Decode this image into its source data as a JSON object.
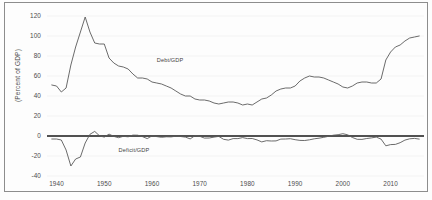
{
  "figure": {
    "ylabel": "(Percent of GDP)",
    "background": "#fdfdfd",
    "frame_color": "#8d8d8d"
  },
  "labels": {
    "debt": "Debt/GDP",
    "deficit": "Deficit/GDP"
  },
  "chart_data": {
    "type": "line",
    "title": "",
    "xlabel": "",
    "ylabel": "(Percent of GDP)",
    "xlim": [
      1938,
      2017
    ],
    "ylim": [
      -40,
      120
    ],
    "xticks": [
      1940,
      1950,
      1960,
      1970,
      1980,
      1990,
      2000,
      2010
    ],
    "xtick_labels": [
      "1940",
      "1950",
      "1960",
      "1970",
      "1980",
      "1990",
      "2000",
      "2010"
    ],
    "yticks": [
      -40,
      -20,
      0,
      20,
      40,
      60,
      80,
      100,
      120
    ],
    "ytick_labels": [
      "-40",
      "-20",
      "0",
      "20",
      "40",
      "60",
      "80",
      "100",
      "120"
    ],
    "grid": true,
    "grid_axis": "y",
    "grid_color": "#eeeeee",
    "legend": "inline-annotations",
    "zero_line": true,
    "zero_line_color": "#1a1a1a",
    "line_color": "#5a5a5a",
    "series": [
      {
        "name": "Debt/GDP",
        "label_position": {
          "x": 1961,
          "y": 76
        },
        "x": [
          1939,
          1940,
          1941,
          1942,
          1943,
          1944,
          1945,
          1946,
          1947,
          1948,
          1949,
          1950,
          1951,
          1952,
          1953,
          1954,
          1955,
          1956,
          1957,
          1958,
          1959,
          1960,
          1961,
          1962,
          1963,
          1964,
          1965,
          1966,
          1967,
          1968,
          1969,
          1970,
          1971,
          1972,
          1973,
          1974,
          1975,
          1976,
          1977,
          1978,
          1979,
          1980,
          1981,
          1982,
          1983,
          1984,
          1985,
          1986,
          1987,
          1988,
          1989,
          1990,
          1991,
          1992,
          1993,
          1994,
          1995,
          1996,
          1997,
          1998,
          1999,
          2000,
          2001,
          2002,
          2003,
          2004,
          2005,
          2006,
          2007,
          2008,
          2009,
          2010,
          2011,
          2012,
          2013,
          2014,
          2015,
          2016
        ],
        "values": [
          51,
          50,
          44,
          48,
          71,
          89,
          104,
          119,
          104,
          93,
          92,
          92,
          78,
          73,
          70,
          69,
          67,
          62,
          58,
          58,
          57,
          54,
          53,
          52,
          50,
          48,
          45,
          42,
          40,
          40,
          37,
          36,
          36,
          35,
          33,
          32,
          33,
          34,
          34,
          33,
          31,
          32,
          31,
          34,
          37,
          38,
          41,
          45,
          47,
          48,
          48,
          50,
          55,
          58,
          60,
          59,
          59,
          58,
          56,
          54,
          52,
          49,
          48,
          50,
          53,
          54,
          54,
          53,
          53,
          57,
          76,
          84,
          89,
          91,
          95,
          98,
          99,
          100
        ]
      },
      {
        "name": "Deficit/GDP",
        "label_position": {
          "x": 1953,
          "y": -14
        },
        "x": [
          1939,
          1940,
          1941,
          1942,
          1943,
          1944,
          1945,
          1946,
          1947,
          1948,
          1949,
          1950,
          1951,
          1952,
          1953,
          1954,
          1955,
          1956,
          1957,
          1958,
          1959,
          1960,
          1961,
          1962,
          1963,
          1964,
          1965,
          1966,
          1967,
          1968,
          1969,
          1970,
          1971,
          1972,
          1973,
          1974,
          1975,
          1976,
          1977,
          1978,
          1979,
          1980,
          1981,
          1982,
          1983,
          1984,
          1985,
          1986,
          1987,
          1988,
          1989,
          1990,
          1991,
          1992,
          1993,
          1994,
          1995,
          1996,
          1997,
          1998,
          1999,
          2000,
          2001,
          2002,
          2003,
          2004,
          2005,
          2006,
          2007,
          2008,
          2009,
          2010,
          2011,
          2012,
          2013,
          2014,
          2015,
          2016
        ],
        "values": [
          -3,
          -3,
          -4,
          -14,
          -30,
          -23,
          -21,
          -7,
          1.7,
          4.6,
          0.2,
          -1.1,
          1.9,
          -0.4,
          -1.7,
          -0.3,
          -0.8,
          0.9,
          0.8,
          -0.6,
          -2.6,
          0.1,
          -0.6,
          -1.3,
          -0.8,
          -0.9,
          -0.2,
          -0.5,
          -1.1,
          -2.9,
          0.3,
          -0.3,
          -2.1,
          -2,
          -1.1,
          -0.4,
          -3.3,
          -4.1,
          -2.6,
          -2.6,
          -1.6,
          -2.6,
          -2.5,
          -3.9,
          -5.9,
          -4.7,
          -5,
          -4.9,
          -3.1,
          -3,
          -2.7,
          -3.7,
          -4.4,
          -4.5,
          -3.8,
          -2.8,
          -2.2,
          -1.3,
          -0.3,
          0.8,
          1.3,
          2.3,
          1.2,
          -1.5,
          -3.3,
          -3.4,
          -2.5,
          -1.9,
          -1.1,
          -3.1,
          -9.8,
          -8.6,
          -8.4,
          -6.7,
          -4.1,
          -2.8,
          -2.4,
          -3.1
        ]
      }
    ]
  }
}
